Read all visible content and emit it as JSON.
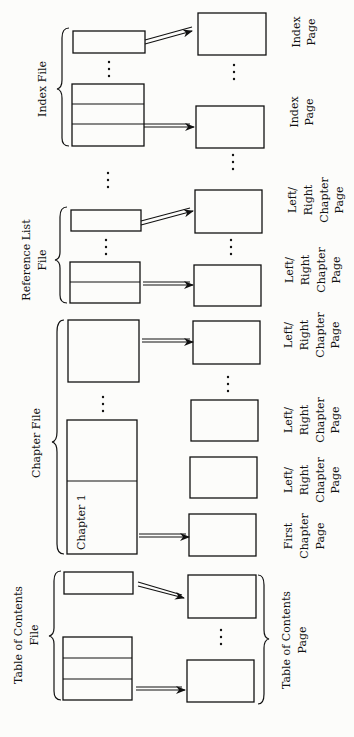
{
  "diagram": {
    "orientation": "rotated-90-ccw",
    "files": [
      {
        "id": "toc",
        "label_lines": [
          "Table of Contents",
          "File"
        ]
      },
      {
        "id": "chapter",
        "label_lines": [
          "Chapter File"
        ],
        "first_record_label": "Chapter 1"
      },
      {
        "id": "reflist",
        "label_lines": [
          "Reference List",
          "File"
        ]
      },
      {
        "id": "index",
        "label_lines": [
          "Index File"
        ]
      }
    ],
    "pages": [
      {
        "id": "toc-page",
        "label_lines": [
          "Table of Contents",
          "Page"
        ]
      },
      {
        "id": "first-chapter-page",
        "label_lines": [
          "First",
          "Chapter",
          "Page"
        ]
      },
      {
        "id": "lr-chapter-page-1",
        "label_lines": [
          "Left/",
          "Right",
          "Chapter",
          "Page"
        ]
      },
      {
        "id": "lr-chapter-page-2",
        "label_lines": [
          "Left/",
          "Right",
          "Chapter",
          "Page"
        ]
      },
      {
        "id": "lr-chapter-page-3",
        "label_lines": [
          "Left/",
          "Right",
          "Chapter",
          "Page"
        ]
      },
      {
        "id": "lr-chapter-page-4",
        "label_lines": [
          "Left/",
          "Right",
          "Chapter",
          "Page"
        ]
      },
      {
        "id": "lr-chapter-page-5",
        "label_lines": [
          "Left/",
          "Right",
          "Chapter",
          "Page"
        ]
      },
      {
        "id": "index-page-1",
        "label_lines": [
          "Index",
          "Page"
        ]
      },
      {
        "id": "index-page-2",
        "label_lines": [
          "Index",
          "Page"
        ]
      }
    ],
    "ellipsis": "..."
  }
}
